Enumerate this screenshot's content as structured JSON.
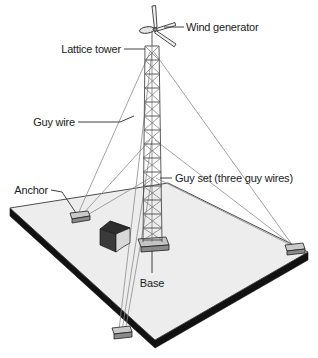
{
  "diagram": {
    "background_color": "#ffffff",
    "labels": [
      {
        "key": "wind_generator",
        "text": "Wind generator"
      },
      {
        "key": "lattice_tower",
        "text": "Lattice tower"
      },
      {
        "key": "guy_wire",
        "text": "Guy wire"
      },
      {
        "key": "anchor",
        "text": "Anchor"
      },
      {
        "key": "guy_set",
        "text": "Guy set (three guy wires)"
      },
      {
        "key": "base",
        "text": "Base"
      }
    ],
    "parts": {
      "ground_plane": "ground-plane",
      "ground_edge": "ground-edge-slab",
      "tower": "lattice-tower",
      "rotor": "wind-generator-rotor",
      "nacelle": "wind-generator-nacelle",
      "base_footing": "tower-base-footing",
      "shed": "equipment-shed",
      "anchors": [
        "anchor-left",
        "anchor-right",
        "anchor-front"
      ],
      "guy_wires": "guy-wire-set"
    },
    "colors": {
      "ground_fill": "#ededed",
      "ground_edge": "#111111",
      "outline": "#2b2b2b",
      "guy_wire": "#8c8c8c",
      "anchor_fill": "#b8b8b8",
      "shed_roof": "#2e2e2e",
      "shed_wall": "#d8d8d8",
      "label_text": "#1b1b1b"
    }
  }
}
